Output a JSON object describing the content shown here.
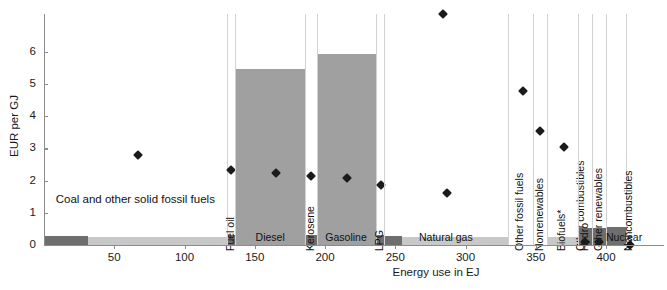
{
  "chart_data": {
    "type": "bar",
    "title": "",
    "xlabel": "Energy use in EJ",
    "ylabel": "EUR per GJ",
    "xlim": [
      0,
      440
    ],
    "ylim": [
      0,
      6.6
    ],
    "xticks": [
      50,
      100,
      150,
      200,
      250,
      300,
      350,
      400
    ],
    "yticks": [
      0,
      1,
      2,
      3,
      4,
      5,
      6
    ],
    "grid": false,
    "legend": null,
    "note": "Marimekko-style chart: bar width = energy use in EJ (x-axis), bar height = EUR per GJ tax rate; diamonds mark a second per-fuel rate.",
    "categories": [
      {
        "label": "Coal and other solid fossil fuels",
        "label_style": "two-line",
        "x_start": 0,
        "x_end": 130,
        "bar_height": 0.25,
        "dark_width": 31,
        "diamond": 2.8,
        "diamond_x": 67
      },
      {
        "label": "Fuel oil",
        "label_style": "vertical",
        "x_start": 130,
        "x_end": 136,
        "bar_height": 0.3,
        "dark_width": 6,
        "diamond": 2.33,
        "diamond_x": 133
      },
      {
        "label": "Diesel",
        "label_style": "horizontal",
        "x_start": 136,
        "x_end": 186,
        "bar_height": 5.47,
        "dark_width": 0,
        "diamond": 2.23,
        "diamond_x": 165
      },
      {
        "label": "Kerosene",
        "label_style": "vertical",
        "x_start": 186,
        "x_end": 194,
        "bar_height": 0.3,
        "dark_width": 8,
        "diamond": 2.13,
        "diamond_x": 190
      },
      {
        "label": "Gasoline",
        "label_style": "horizontal",
        "x_start": 194,
        "x_end": 236,
        "bar_height": 5.93,
        "dark_width": 0,
        "diamond": 2.08,
        "diamond_x": 216
      },
      {
        "label": "LPG",
        "label_style": "vertical",
        "x_start": 236,
        "x_end": 242,
        "bar_height": 0.3,
        "dark_width": 6,
        "diamond": 1.87,
        "diamond_x": 240
      },
      {
        "label": "Natural gas",
        "label_style": "horizontal",
        "x_start": 242,
        "x_end": 330,
        "bar_height": 0.25,
        "dark_width": 13,
        "diamond": 1.63,
        "diamond_x": 287
      },
      {
        "label": "Other fossil fuels",
        "label_style": "vertical",
        "x_start": 330,
        "x_end": 348,
        "bar_height": 0.0,
        "dark_width": 0,
        "diamond": 4.78,
        "diamond_x": 341
      },
      {
        "label": "Nonrenewables",
        "label_style": "vertical",
        "x_start": 348,
        "x_end": 358,
        "bar_height": 0.0,
        "dark_width": 0,
        "diamond": 3.53,
        "diamond_x": 353
      },
      {
        "label": "Biofuels*",
        "label_style": "vertical",
        "x_start": 358,
        "x_end": 380,
        "bar_height": 0.25,
        "dark_width": 0,
        "diamond": 3.05,
        "diamond_x": 370
      },
      {
        "label": "Other combustibles",
        "label_style": "vertical",
        "x_start": 380,
        "x_end": 380,
        "bar_height": 0.0,
        "dark_width": 0,
        "diamond": 7.17,
        "diamond_x": 284
      },
      {
        "label": "Hydro",
        "label_style": "vertical",
        "x_start": 380,
        "x_end": 390,
        "bar_height": 0.52,
        "dark_width": 10,
        "diamond": 0.08,
        "diamond_x": 385
      },
      {
        "label": "Other renewables",
        "label_style": "vertical",
        "x_start": 390,
        "x_end": 400,
        "bar_height": 0.52,
        "dark_width": 10,
        "diamond": 0.08,
        "diamond_x": 395
      },
      {
        "label": "Nuclear",
        "label_style": "horizontal",
        "x_start": 400,
        "x_end": 414,
        "bar_height": 0.55,
        "dark_width": 14,
        "diamond": 0.0,
        "diamond_x": 417
      },
      {
        "label": "Noncombustibles",
        "label_style": "vertical",
        "x_start": 414,
        "x_end": 414,
        "bar_height": 0.0,
        "dark_width": 0,
        "diamond": null,
        "diamond_x": null
      }
    ]
  },
  "axes": {
    "y_title": "EUR per GJ",
    "x_title": "Energy use in EJ",
    "y_tick_labels": [
      "0",
      "1",
      "2",
      "3",
      "4",
      "5",
      "6"
    ],
    "x_tick_labels": [
      "50",
      "100",
      "150",
      "200",
      "250",
      "300",
      "350",
      "400"
    ]
  },
  "labels": {
    "coal": "Coal and other solid fossil fuels",
    "fuel_oil": "Fuel oil",
    "diesel": "Diesel",
    "kerosene": "Kerosene",
    "gasoline": "Gasoline",
    "lpg": "LPG",
    "natural_gas": "Natural gas",
    "other_fossil_fuels": "Other fossil fuels",
    "nonrenewables": "Nonrenewables",
    "biofuels": "Biofuels*",
    "other_combustibles": "Other combustibles",
    "hydro": "Hydro",
    "other_renewables": "Other renewables",
    "nuclear": "Nuclear",
    "noncombustibles": "Noncombustibles"
  },
  "colors": {
    "bar_tall": "#a0a0a0",
    "bar_base": "#c8c8c8",
    "bar_dark": "#6e6e6e",
    "axis": "#8c8c8c",
    "marker": "#1b1b1b",
    "text": "#1a1a1a"
  }
}
